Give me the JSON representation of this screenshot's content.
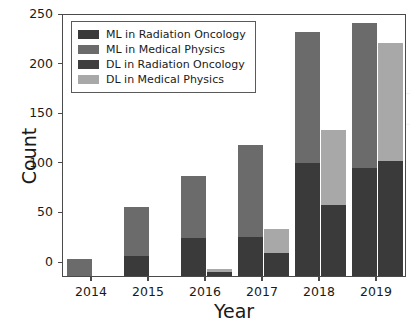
{
  "chart_data": {
    "type": "bar",
    "title": "",
    "xlabel": "Year",
    "ylabel": "Count",
    "categories": [
      "2014",
      "2015",
      "2016",
      "2017",
      "2018",
      "2019"
    ],
    "ylim": [
      0,
      265
    ],
    "yticks": [
      0,
      50,
      100,
      150,
      200,
      250
    ],
    "ytick_labels": [
      "0",
      "50",
      "100",
      "150",
      "200",
      "250"
    ],
    "grid": false,
    "legend_position": "upper left",
    "stacked": true,
    "grouped": true,
    "groups": [
      {
        "name": "ML",
        "series": [
          {
            "name": "ML in Radiation Oncology",
            "color": "#3a3a3a",
            "values": [
              0,
              20,
              38,
              39,
              114,
              109
            ]
          },
          {
            "name": "ML in Medical Physics",
            "color": "#6b6b6b",
            "values": [
              17,
              50,
              63,
              93,
              132,
              146
            ]
          }
        ],
        "totals": [
          17,
          70,
          101,
          132,
          246,
          255
        ]
      },
      {
        "name": "DL",
        "series": [
          {
            "name": "DL in Radiation Oncology",
            "color": "#3a3a3a",
            "values": [
              0,
              0,
              4,
              23,
              72,
              116
            ]
          },
          {
            "name": "DL in Medical Physics",
            "color": "#a8a8a8",
            "values": [
              0,
              0,
              3,
              24,
              75,
              119
            ]
          }
        ],
        "totals": [
          0,
          0,
          7,
          47,
          147,
          235
        ]
      }
    ],
    "legend": [
      {
        "label": "ML in Radiation Oncology",
        "color": "#3a3a3a"
      },
      {
        "label": "ML in Medical Physics",
        "color": "#6b6b6b"
      },
      {
        "label": "DL in Radiation Oncology",
        "color": "#3f3f3f"
      },
      {
        "label": "DL in Medical Physics",
        "color": "#a8a8a8"
      }
    ],
    "colors": {
      "ml_radiation_oncology": "#3a3a3a",
      "ml_medical_physics": "#6b6b6b",
      "dl_radiation_oncology": "#3f3f3f",
      "dl_medical_physics": "#a8a8a8",
      "axis": "#4a4a4a",
      "text": "#1a1a1a",
      "background": "#ffffff"
    }
  }
}
